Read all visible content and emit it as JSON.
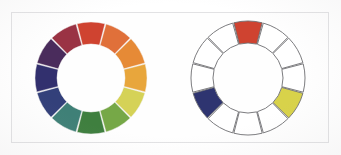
{
  "figure": {
    "background_color": "#ffffff",
    "frame_border_color": "#e2e2e4"
  },
  "wheels": [
    {
      "name": "full-color-wheel",
      "label": "Twelve-segment color wheel",
      "center_x": 89,
      "center_y": 78,
      "outer_radius": 56,
      "inner_radius": 34,
      "segment_count": 12,
      "gap_degrees": 1.2,
      "stroke_color": "#f2f0ee",
      "segments": [
        {
          "index": 0,
          "position": "12 o'clock",
          "hue_name": "red",
          "fill": "#cf4330"
        },
        {
          "index": 1,
          "position": "1 o'clock",
          "hue_name": "red-orange",
          "fill": "#e0703a"
        },
        {
          "index": 2,
          "position": "2 o'clock",
          "hue_name": "orange",
          "fill": "#e68a36"
        },
        {
          "index": 3,
          "position": "3 o'clock",
          "hue_name": "yellow-orange",
          "fill": "#e9a martial"
        },
        {
          "index": 4,
          "position": "4 o'clock",
          "hue_name": "yellow",
          "fill": "#d9d košice"
        },
        {
          "index": 5,
          "position": "5 o'clock",
          "hue_name": "yellow-green",
          "fill": "#76a847"
        },
        {
          "index": 6,
          "position": "6 o'clock",
          "hue_name": "green",
          "fill": "#3f7f3f"
        },
        {
          "index": 7,
          "position": "7 o'clock",
          "hue_name": "blue-green",
          "fill": "#3f8077"
        },
        {
          "index": 8,
          "position": "8 o'clock",
          "hue_name": "blue",
          "fill": "#33407a"
        },
        {
          "index": 9,
          "position": "9 o'clock",
          "hue_name": "blue-violet",
          "fill": "#32306e"
        },
        {
          "index": 10,
          "position": "10 o'clock",
          "hue_name": "violet",
          "fill": "#4a2c5c"
        },
        {
          "index": 11,
          "position": "11 o'clock",
          "hue_name": "red-violet",
          "fill": "#9a3344"
        }
      ]
    },
    {
      "name": "triadic-scheme-wheel",
      "label": "Twelve-segment outline wheel with triadic harmony highlighted",
      "center_x": 246,
      "center_y": 78,
      "outer_radius": 57,
      "inner_radius": 35,
      "segment_count": 12,
      "gap_degrees": 1.2,
      "stroke_color": "#6d6d70",
      "empty_fill": "#ffffff",
      "segments": [
        {
          "index": 0,
          "position": "12 o'clock",
          "hue_name": "red",
          "fill": "#cf4330",
          "highlighted": true
        },
        {
          "index": 1,
          "position": "1 o'clock",
          "hue_name": "red-orange",
          "fill": "#ffffff",
          "highlighted": false
        },
        {
          "index": 2,
          "position": "2 o'clock",
          "hue_name": "orange",
          "fill": "#ffffff",
          "highlighted": false
        },
        {
          "index": 3,
          "position": "3 o'clock",
          "hue_name": "yellow-orange",
          "fill": "#ffffff",
          "highlighted": false
        },
        {
          "index": 4,
          "position": "4 o'clock",
          "hue_name": "yellow",
          "fill": "#d8d24a",
          "highlighted": true
        },
        {
          "index": 5,
          "position": "5 o'clock",
          "hue_name": "yellow-green",
          "fill": "#ffffff",
          "highlighted": false
        },
        {
          "index": 6,
          "position": "6 o'clock",
          "hue_name": "green",
          "fill": "#ffffff",
          "highlighted": false
        },
        {
          "index": 7,
          "position": "7 o'clock",
          "hue_name": "blue-green",
          "fill": "#ffffff",
          "highlighted": false
        },
        {
          "index": 8,
          "position": "8 o'clock",
          "hue_name": "blue",
          "fill": "#2e3470",
          "highlighted": true
        },
        {
          "index": 9,
          "position": "9 o'clock",
          "hue_name": "blue-violet",
          "fill": "#ffffff",
          "highlighted": false
        },
        {
          "index": 10,
          "position": "10 o'clock",
          "hue_name": "violet",
          "fill": "#ffffff",
          "highlighted": false
        },
        {
          "index": 11,
          "position": "11 o'clock",
          "hue_name": "red-violet",
          "fill": "#ffffff",
          "highlighted": false
        }
      ]
    }
  ]
}
